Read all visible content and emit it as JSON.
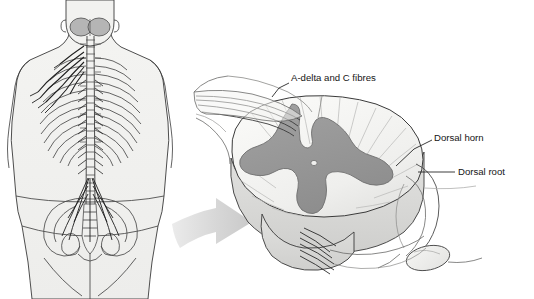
{
  "figure": {
    "background_color": "#ffffff"
  },
  "palette": {
    "background": "#ffffff",
    "gray_matter": "#9a9a9a",
    "gray_matter_dark": "#8d8d8d",
    "white_matter": "#f2f2f0",
    "white_matter_shadow": "#e3e3e1",
    "cord_depth_band": "#d8d8d6",
    "body_fill": "#f2f2f0",
    "body_outline": "#3a3a3a",
    "bone_line": "#4a4a4a",
    "nerve_line": "#1f1f1f",
    "brain_fill": "#b5b5b5",
    "arrow_fill": "#d5d5d5",
    "label_text": "#151515",
    "leader_line": "#1a1a1a",
    "ganglion_fill": "#efefed"
  },
  "labels": [
    {
      "id": "a-delta-and-c-fibres",
      "text": "A-delta and C fibres",
      "x": 291,
      "y": 78,
      "anchor": "start",
      "leader": "M 289 83 L 279 88 L 272 97"
    },
    {
      "id": "dorsal-horn",
      "text": "Dorsal horn",
      "x": 434,
      "y": 138,
      "anchor": "start",
      "leader": "M 432 140 L 414 149 L 396 166"
    },
    {
      "id": "dorsal-root",
      "text": "Dorsal root",
      "x": 458,
      "y": 172,
      "anchor": "start",
      "leader": "M 455 172 L 418 172"
    }
  ],
  "panels": {
    "body_view": {
      "name": "posterior-body-spine-view",
      "description": "Posterior view of human torso showing brain, vertebral column, ribs, pelvis and spinal nerves"
    },
    "cord_view": {
      "name": "spinal-cord-cross-section",
      "description": "Enlarged three-dimensional spinal cord segment showing butterfly shaped grey matter, dorsal horn, dorsal root and ganglion"
    },
    "arrow": {
      "name": "magnification-arrow",
      "description": "Large grey arrow pointing from body view to enlarged cord view"
    }
  },
  "anatomy_parts": [
    {
      "id": "brain",
      "label": "brain"
    },
    {
      "id": "vertebral-column",
      "label": "vertebral column"
    },
    {
      "id": "ribs",
      "label": "ribs"
    },
    {
      "id": "pelvis",
      "label": "pelvis"
    },
    {
      "id": "brachial-plexus-nerves",
      "label": "brachial plexus nerves"
    },
    {
      "id": "cauda-equina",
      "label": "cauda equina"
    },
    {
      "id": "grey-matter",
      "label": "grey matter"
    },
    {
      "id": "white-matter",
      "label": "white matter"
    },
    {
      "id": "central-canal",
      "label": "central canal"
    },
    {
      "id": "dorsal-root-ganglion",
      "label": "dorsal root ganglion"
    },
    {
      "id": "ventral-rootlets",
      "label": "ventral rootlets"
    },
    {
      "id": "afferent-fibre-bundle",
      "label": "afferent fibre bundle"
    }
  ]
}
